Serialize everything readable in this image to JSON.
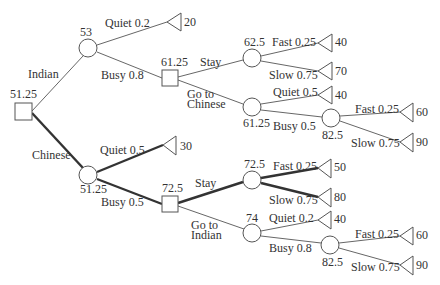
{
  "diagram": {
    "type": "decision-tree",
    "colors": {
      "line": "#555555",
      "bold_line": "#333333",
      "text": "#333333",
      "background": "#ffffff"
    },
    "nodes": [
      {
        "id": "root",
        "kind": "decision",
        "value": "51.25"
      },
      {
        "id": "indian",
        "kind": "chance",
        "value": "53"
      },
      {
        "id": "indian_quiet",
        "kind": "terminal",
        "value": "20"
      },
      {
        "id": "indian_busy_dec",
        "kind": "decision",
        "value": "61.25"
      },
      {
        "id": "stay_ind",
        "kind": "chance",
        "value": "62.5"
      },
      {
        "id": "stay_ind_fast",
        "kind": "terminal",
        "value": "40"
      },
      {
        "id": "stay_ind_slow",
        "kind": "terminal",
        "value": "70"
      },
      {
        "id": "goto_chinese",
        "kind": "chance",
        "value": "61.25"
      },
      {
        "id": "goto_chinese_quiet",
        "kind": "terminal",
        "value": "40"
      },
      {
        "id": "goto_chinese_busy",
        "kind": "chance",
        "value": "82.5"
      },
      {
        "id": "goto_chinese_busy_fast",
        "kind": "terminal",
        "value": "60"
      },
      {
        "id": "goto_chinese_busy_slow",
        "kind": "terminal",
        "value": "90"
      },
      {
        "id": "chinese",
        "kind": "chance",
        "value": "51.25"
      },
      {
        "id": "chinese_quiet",
        "kind": "terminal",
        "value": "30"
      },
      {
        "id": "chinese_busy_dec",
        "kind": "decision",
        "value": "72.5"
      },
      {
        "id": "stay_chi",
        "kind": "chance",
        "value": "72.5"
      },
      {
        "id": "stay_chi_fast",
        "kind": "terminal",
        "value": "50"
      },
      {
        "id": "stay_chi_slow",
        "kind": "terminal",
        "value": "80"
      },
      {
        "id": "goto_indian",
        "kind": "chance",
        "value": "74"
      },
      {
        "id": "goto_indian_quiet",
        "kind": "terminal",
        "value": "40"
      },
      {
        "id": "goto_indian_busy",
        "kind": "chance",
        "value": "82.5"
      },
      {
        "id": "goto_indian_busy_fast",
        "kind": "terminal",
        "value": "60"
      },
      {
        "id": "goto_indian_busy_slow",
        "kind": "terminal",
        "value": "90"
      }
    ],
    "edge_labels": {
      "indian": "Indian",
      "chinese": "Chinese",
      "indian_quiet": "Quiet 0.2",
      "indian_busy": "Busy 0.8",
      "stay_ind": "Stay",
      "goto_chinese_1": "Go to",
      "goto_chinese_2": "Chinese",
      "stay_ind_fast": "Fast 0.25",
      "stay_ind_slow": "Slow 0.75",
      "goto_chinese_quiet": "Quiet 0.5",
      "goto_chinese_busy": "Busy 0.5",
      "goto_chinese_busy_fast": "Fast 0.25",
      "goto_chinese_busy_slow": "Slow 0.75",
      "chinese_quiet": "Quiet 0.5",
      "chinese_busy": "Busy 0.5",
      "stay_chi": "Stay",
      "goto_indian_1": "Go to",
      "goto_indian_2": "Indian",
      "stay_chi_fast": "Fast 0.25",
      "stay_chi_slow": "Slow 0.75",
      "goto_indian_quiet": "Quiet 0.2",
      "goto_indian_busy": "Busy 0.8",
      "goto_indian_busy_fast": "Fast 0.25",
      "goto_indian_busy_slow": "Slow 0.75"
    },
    "optimal_path": [
      "root",
      "chinese",
      "chinese_busy_dec",
      "stay_chi",
      "stay_chi_fast",
      "stay_chi_slow",
      "chinese_quiet"
    ]
  }
}
